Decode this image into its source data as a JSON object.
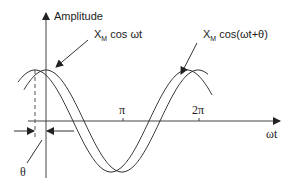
{
  "diagram": {
    "y_axis_label": "Amplitude",
    "x_axis_label": "ωt",
    "ticks": [
      {
        "label": "π",
        "value": 3.14159
      },
      {
        "label": "2π",
        "value": 6.28318
      }
    ],
    "phase_label": "θ",
    "curves": [
      {
        "name": "reference",
        "label_main": "X",
        "label_sub": "M",
        "label_rest": " cos ωt",
        "expression": "X_M cos(ωt)"
      },
      {
        "name": "leading",
        "label_main": "X",
        "label_sub": "M",
        "label_rest": " cos(ωt+θ)",
        "expression": "X_M cos(ωt+θ)"
      }
    ],
    "colors": {
      "line": "#333333",
      "axis": "#444444",
      "dashed": "#555555"
    }
  },
  "chart_data": {
    "type": "line",
    "title": "",
    "xlabel": "ωt",
    "ylabel": "Amplitude",
    "xticks": [
      "π",
      "2π"
    ],
    "series": [
      {
        "name": "X_M cos ωt",
        "function": "cos(x)",
        "x_range": [
          0,
          6.6
        ]
      },
      {
        "name": "X_M cos(ωt+θ)",
        "function": "cos(x+θ)",
        "theta_approx_rad": 0.44,
        "x_range": [
          -0.44,
          6.6
        ]
      }
    ],
    "annotations": [
      "θ (phase offset between peaks)",
      "X_M cos ωt",
      "X_M cos(ωt+θ)"
    ],
    "grid": false
  }
}
